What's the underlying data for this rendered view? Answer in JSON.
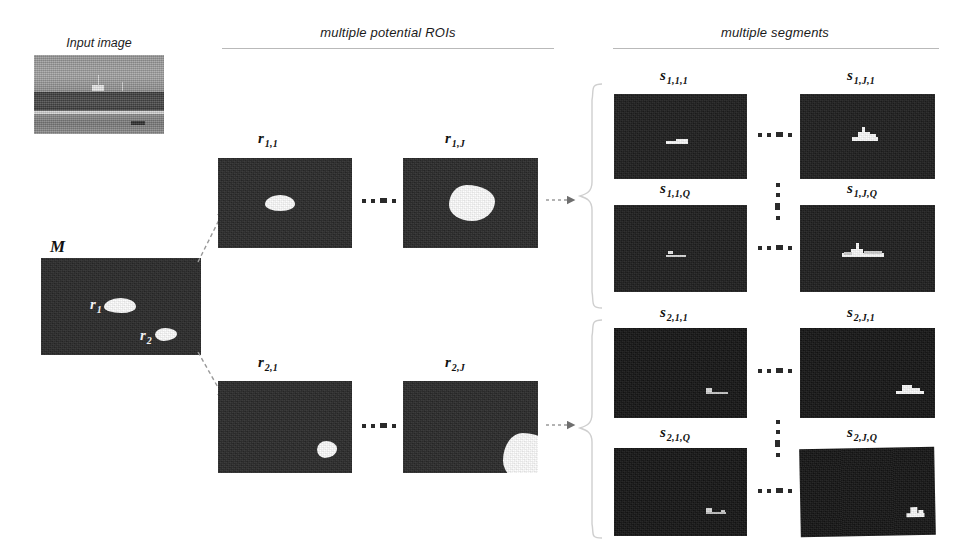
{
  "figure": {
    "sections": [
      {
        "id": "input",
        "label": "Input image"
      },
      {
        "id": "rois",
        "label": "multiple potential ROIs"
      },
      {
        "id": "segments",
        "label": "multiple segments"
      }
    ]
  },
  "input_panel": {
    "caption": "Input image",
    "description": "grayscale maritime horizon scene with small vessel"
  },
  "mask_panel": {
    "label": "M",
    "regions": [
      {
        "label": "r",
        "sub": "1"
      },
      {
        "label": "r",
        "sub": "2"
      }
    ]
  },
  "roi_row_1": {
    "panels": [
      {
        "label": "r",
        "sub": "1,1"
      },
      {
        "label": "r",
        "sub": "1,J"
      }
    ],
    "ellipsis": "..."
  },
  "roi_row_2": {
    "panels": [
      {
        "label": "r",
        "sub": "2,1"
      },
      {
        "label": "r",
        "sub": "2,J"
      }
    ],
    "ellipsis": "..."
  },
  "segment_group_1": {
    "rows": [
      {
        "panels": [
          {
            "label": "s",
            "sub": "1,1,1"
          },
          {
            "label": "s",
            "sub": "1,J,1"
          }
        ]
      },
      {
        "panels": [
          {
            "label": "s",
            "sub": "1,1,Q"
          },
          {
            "label": "s",
            "sub": "1,J,Q"
          }
        ]
      }
    ]
  },
  "segment_group_2": {
    "rows": [
      {
        "panels": [
          {
            "label": "s",
            "sub": "2,1,1"
          },
          {
            "label": "s",
            "sub": "2,J,1"
          }
        ]
      },
      {
        "panels": [
          {
            "label": "s",
            "sub": "2,1,Q"
          },
          {
            "label": "s",
            "sub": "2,J,Q"
          }
        ]
      }
    ]
  },
  "colors": {
    "background": "#ffffff",
    "panel_dark": "#2a2a2a",
    "panel_darker": "#1e1e1e",
    "blob_white": "#fdfdfd",
    "rule": "#b9b9b9",
    "text": "#111111",
    "arrow": "#6e6e6e"
  }
}
